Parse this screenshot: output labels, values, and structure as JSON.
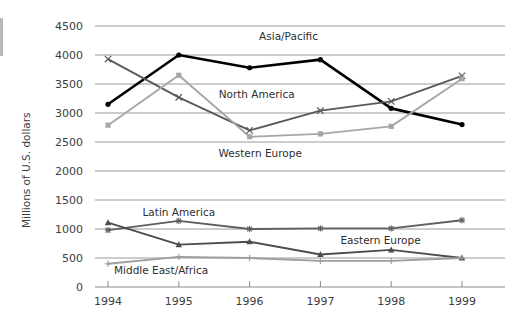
{
  "chart_data": {
    "type": "line",
    "title": "",
    "xlabel": "",
    "ylabel": "Millions of U.S. dollars",
    "categories": [
      "1994",
      "1995",
      "1996",
      "1997",
      "1998",
      "1999"
    ],
    "x": [
      1994,
      1995,
      1996,
      1997,
      1998,
      1999
    ],
    "ylim": [
      0,
      4500
    ],
    "ytick_step": 500,
    "yticks": [
      "0",
      "500",
      "1000",
      "1500",
      "2000",
      "2500",
      "3000",
      "3500",
      "4000",
      "4500"
    ],
    "grid": "horizontal",
    "legend_position": "inline-labels",
    "series": [
      {
        "name": "Asia/Pacific",
        "color": "#000000",
        "marker": "circle",
        "values": [
          3150,
          4000,
          3780,
          3920,
          3080,
          2800
        ],
        "label_x": 1996.55,
        "label_y": 4320
      },
      {
        "name": "North America",
        "color": "#595959",
        "marker": "x",
        "values": [
          3930,
          3270,
          2700,
          3040,
          3200,
          3640
        ],
        "label_x": 1996.1,
        "label_y": 3330
      },
      {
        "name": "Western Europe",
        "color": "#a6a6a6",
        "marker": "square",
        "values": [
          2790,
          3650,
          2590,
          2640,
          2770,
          3590
        ],
        "label_x": 1996.15,
        "label_y": 2310
      },
      {
        "name": "Latin America",
        "color": "#5e5e5e",
        "marker": "asterisk",
        "values": [
          980,
          1140,
          1000,
          1010,
          1010,
          1150
        ],
        "label_x": 1995.0,
        "label_y": 1290
      },
      {
        "name": "Eastern Europe",
        "color": "#4d4d4d",
        "marker": "triangle",
        "values": [
          1110,
          730,
          780,
          560,
          640,
          500
        ],
        "label_x": 1997.85,
        "label_y": 810
      },
      {
        "name": "Middle East/Africa",
        "color": "#9e9e9e",
        "marker": "plus",
        "values": [
          400,
          520,
          500,
          450,
          450,
          500
        ],
        "label_x": 1994.75,
        "label_y": 290
      }
    ]
  },
  "axis": {
    "y_title": "Millions of U.S. dollars"
  }
}
